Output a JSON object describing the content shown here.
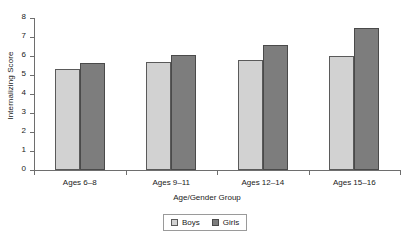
{
  "chart_data": {
    "type": "bar",
    "title": "",
    "xlabel": "Age/Gender Group",
    "ylabel": "Internalizing Score",
    "categories": [
      "Ages 6–8",
      "Ages 9–11",
      "Ages 12–14",
      "Ages 15–16"
    ],
    "series": [
      {
        "name": "Boys",
        "color": "#d2d2d2",
        "values": [
          5.3,
          5.7,
          5.8,
          6.0
        ]
      },
      {
        "name": "Girls",
        "color": "#7d7d7d",
        "values": [
          5.65,
          6.05,
          6.6,
          7.5
        ]
      }
    ],
    "ylim": [
      0,
      8
    ],
    "yticks": [
      "0",
      "1",
      "2",
      "3",
      "4",
      "5",
      "6",
      "7",
      "8"
    ],
    "grid": false,
    "legend_position": "bottom-center"
  },
  "legend": {
    "items": [
      {
        "label": "Boys"
      },
      {
        "label": "Girls"
      }
    ]
  }
}
